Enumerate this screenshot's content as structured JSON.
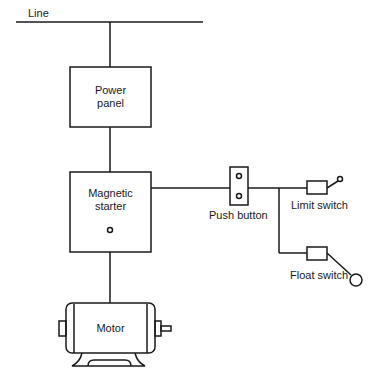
{
  "diagram": {
    "line_label": "Line",
    "power_panel": {
      "line1": "Power",
      "line2": "panel"
    },
    "magnetic_starter": {
      "line1": "Magnetic",
      "line2": "starter"
    },
    "push_button": "Push button",
    "limit_switch": "Limit switch",
    "float_switch": "Float switch",
    "motor": "Motor",
    "colors": {
      "stroke": "#1a1a1a",
      "background": "#ffffff"
    }
  }
}
